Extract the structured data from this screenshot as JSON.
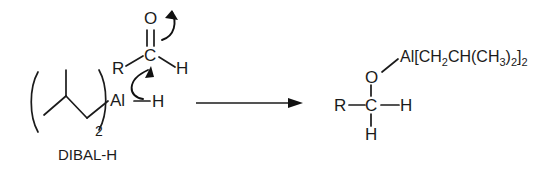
{
  "figure": {
    "background_color": "#ffffff",
    "line_color": "#1b1b1b"
  },
  "reactants": {
    "reagent": {
      "name_label": "DIBAL-H",
      "aluminum_label": "Al",
      "hydride_label": "H",
      "repeat_subscript": "2",
      "left_paren": "(",
      "right_paren": ")"
    },
    "aldehyde": {
      "oxygen_label": "O",
      "carbon_label": "C",
      "r_group_label": "R",
      "hydrogen_label": "H"
    },
    "arrows": {
      "pi_bond_arrow_name": "carbonyl-pi-to-oxygen-arrow",
      "hydride_arrow_name": "hydride-to-carbonyl-carbon-arrow"
    }
  },
  "reaction_arrow": {
    "direction": "right"
  },
  "product": {
    "r_group_label": "R",
    "carbon_label": "C",
    "hydrogen_right_label": "H",
    "hydrogen_bottom_label": "H",
    "oxygen_label": "O",
    "aluminum_group": {
      "full_text": "Al[CH2CH(CH3)2]2",
      "part_1": "Al[CH",
      "sub_1": "2",
      "part_2": "CH(CH",
      "sub_2": "3",
      "part_3": ")",
      "sub_3": "2",
      "part_4": "]",
      "sub_4": "2"
    }
  }
}
